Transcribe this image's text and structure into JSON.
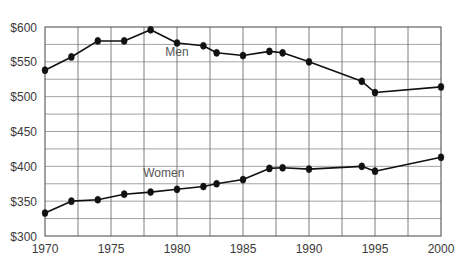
{
  "chart_data": {
    "type": "line",
    "title": "",
    "subtitle": "",
    "xlabel": "",
    "ylabel": "",
    "xlim": [
      1970,
      2000
    ],
    "ylim": [
      300,
      600
    ],
    "grid": true,
    "legend_position": "inline-annotation",
    "y_ticks": [
      300,
      350,
      400,
      450,
      500,
      550,
      600
    ],
    "y_tick_labels": [
      "$300",
      "$350",
      "$400",
      "$450",
      "$500",
      "$550",
      "$600"
    ],
    "y_minor_gridline_step": 25,
    "x_ticks": [
      1970,
      1975,
      1980,
      1985,
      1990,
      1995,
      2000
    ],
    "x_tick_labels": [
      "1970",
      "1975",
      "1980",
      "1985",
      "1990",
      "1995",
      "2000"
    ],
    "x_gridline_step": 2.5,
    "x": [
      1970,
      1972,
      1974,
      1976,
      1978,
      1980,
      1982,
      1983,
      1985,
      1987,
      1988,
      1990,
      1994,
      1995,
      2000
    ],
    "series": [
      {
        "name": "Men",
        "label": "Men",
        "color": "#111111",
        "label_x": 1980,
        "label_y": 558,
        "values": [
          538,
          557,
          580,
          580,
          596,
          577,
          573,
          563,
          559,
          565,
          563,
          550,
          522,
          506,
          514
        ]
      },
      {
        "name": "Women",
        "label": "Women",
        "color": "#111111",
        "label_x": 1979,
        "label_y": 385,
        "values": [
          333,
          350,
          352,
          360,
          363,
          367,
          371,
          375,
          381,
          397,
          398,
          396,
          400,
          393,
          413
        ]
      }
    ]
  },
  "colors": {
    "background": "#ffffff",
    "line": "#111111",
    "marker": "#111111",
    "horizontal_gridline": "#9a9a9a",
    "vertical_gridline": "#6f6f6f",
    "plot_border": "#555555",
    "tick_text": "#3a3a3a",
    "series_label_text": "#555555"
  }
}
